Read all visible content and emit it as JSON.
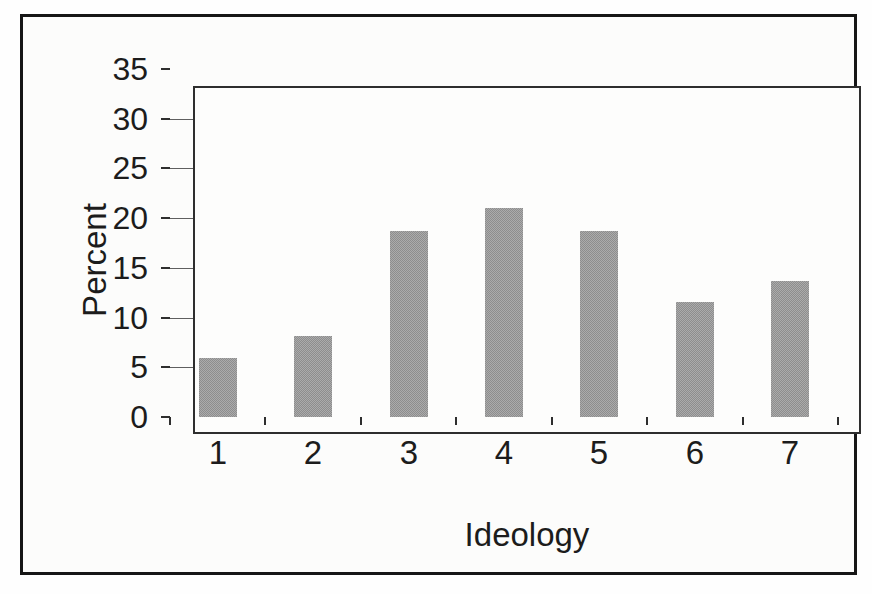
{
  "chart_data": {
    "type": "bar",
    "categories": [
      "1",
      "2",
      "3",
      "4",
      "5",
      "6",
      "7"
    ],
    "values": [
      5.9,
      8.1,
      18.7,
      21.0,
      18.7,
      11.6,
      13.7
    ],
    "title": "",
    "xlabel": "Ideology",
    "ylabel": "Percent",
    "ylim": [
      0,
      35
    ],
    "yticks": [
      0,
      5,
      10,
      15,
      20,
      25,
      30,
      35
    ],
    "ytick_step": 5,
    "grid": "horizontal",
    "legend": "none",
    "bar_color": "#9b9b9b",
    "bar_dither_dark": "#8d8d8d",
    "bar_dither_light": "#ababab",
    "frame_border_color": "#161616",
    "plot_border_color": "#2e2e2e",
    "gridline_color": "#5f5f5f",
    "text_color": "#1c1c1c",
    "background_color": "#fcfcfb"
  }
}
